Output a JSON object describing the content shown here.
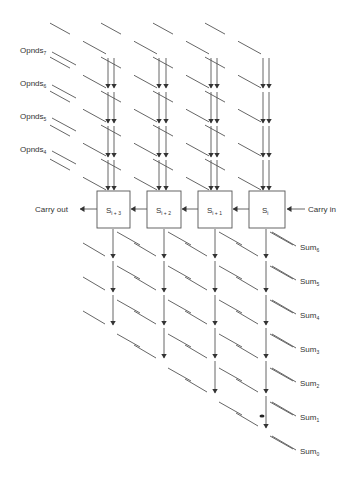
{
  "diagram": {
    "type": "systolic-adder-array",
    "operand_labels": [
      {
        "base": "Opnds",
        "sub": "7"
      },
      {
        "base": "Opnds",
        "sub": "6"
      },
      {
        "base": "Opnds",
        "sub": "5"
      },
      {
        "base": "Opnds",
        "sub": "4"
      }
    ],
    "cells": [
      {
        "base": "S",
        "sub": "i + 3"
      },
      {
        "base": "S",
        "sub": "i + 2"
      },
      {
        "base": "S",
        "sub": "i + 1"
      },
      {
        "base": "S",
        "sub": "i"
      }
    ],
    "carry_out_label": "Carry out",
    "carry_in_label": "Carry in",
    "sum_labels": [
      {
        "base": "Sum",
        "sub": "6"
      },
      {
        "base": "Sum",
        "sub": "5"
      },
      {
        "base": "Sum",
        "sub": "4"
      },
      {
        "base": "Sum",
        "sub": "3"
      },
      {
        "base": "Sum",
        "sub": "2"
      },
      {
        "base": "Sum",
        "sub": "1"
      },
      {
        "base": "Sum",
        "sub": "0"
      }
    ],
    "colors": {
      "line": "#555555",
      "text": "#333333",
      "background": "#ffffff"
    }
  }
}
